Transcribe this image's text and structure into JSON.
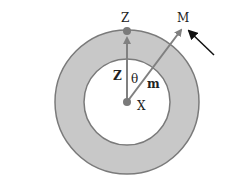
{
  "diagram": {
    "labels": {
      "top_point": "Z",
      "external_point": "M",
      "center": "X",
      "vector_z": "Z",
      "vector_m": "m",
      "angle": "θ"
    },
    "colors": {
      "ring_fill": "#c8c8c8",
      "ring_stroke": "#7a7a7a",
      "vector": "#808080",
      "point": "#7a7a7a",
      "pointer_arrow": "#111111"
    }
  }
}
